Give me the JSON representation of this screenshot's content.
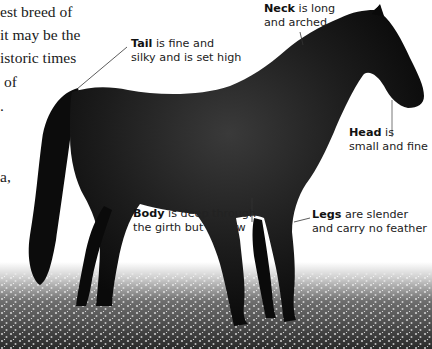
{
  "body_text": {
    "lines": [
      "est breed of",
      "it may be the",
      "istoric times",
      "of",
      ".",
      "",
      "",
      "a,"
    ]
  },
  "image": {
    "subject": "dark bay horse standing in a field of white flowers",
    "background_color": "#ffffff",
    "horse_color": "#111111"
  },
  "annotations": [
    {
      "id": "neck",
      "term": "Neck",
      "rest_line1": " is long",
      "line2": "and arched"
    },
    {
      "id": "tail",
      "term": "Tail",
      "rest_line1": " is fine and",
      "line2": "silky and is set high"
    },
    {
      "id": "head",
      "term": "Head",
      "rest_line1": " is",
      "line2": "small and fine"
    },
    {
      "id": "body",
      "term": "Body",
      "rest_line1": " is deep through",
      "line2": "the girth but narrow"
    },
    {
      "id": "legs",
      "term": "Legs",
      "rest_line1": " are slender",
      "line2": "and carry no feather"
    }
  ]
}
